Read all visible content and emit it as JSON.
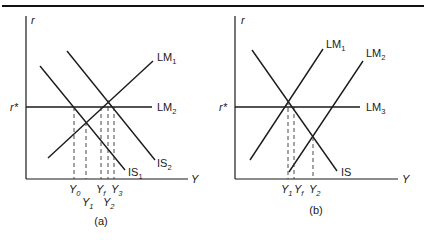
{
  "panels": {
    "a": {
      "caption": "(a)",
      "y_axis_label": "r",
      "x_axis_label": "Y",
      "r_star_label": "r*",
      "curves": {
        "LM1": {
          "name": "LM",
          "sub": "1"
        },
        "LM2": {
          "name": "LM",
          "sub": "2"
        },
        "IS1": {
          "name": "IS",
          "sub": "1"
        },
        "IS2": {
          "name": "IS",
          "sub": "2"
        }
      },
      "ticks": [
        {
          "name": "Y",
          "sub": "0"
        },
        {
          "name": "Y",
          "sub": "1"
        },
        {
          "name": "Y",
          "sub": "f"
        },
        {
          "name": "Y",
          "sub": "2"
        },
        {
          "name": "Y",
          "sub": "3"
        }
      ]
    },
    "b": {
      "caption": "(b)",
      "y_axis_label": "r",
      "x_axis_label": "Y",
      "r_star_label": "r*",
      "curves": {
        "LM1": {
          "name": "LM",
          "sub": "1"
        },
        "LM2": {
          "name": "LM",
          "sub": "2"
        },
        "LM3": {
          "name": "LM",
          "sub": "3"
        },
        "IS": {
          "name": "IS",
          "sub": ""
        }
      },
      "ticks": [
        {
          "name": "Y",
          "sub": "1"
        },
        {
          "name": "Y",
          "sub": "f"
        },
        {
          "name": "Y",
          "sub": "2"
        }
      ]
    }
  },
  "colors": {
    "line": "#1a1a1a",
    "background": "#ffffff"
  }
}
